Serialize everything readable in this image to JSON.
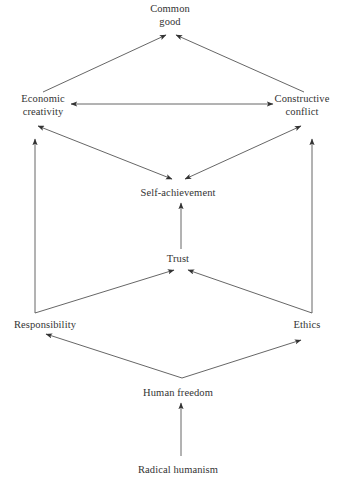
{
  "diagram": {
    "stroke_color": "#444444",
    "text_color": "#333333",
    "background": "#ffffff",
    "nodes": [
      {
        "id": "common_good",
        "label": "Common\ngood",
        "x": 170,
        "y": 14
      },
      {
        "id": "economic",
        "label": "Economic\ncreativity",
        "x": 43,
        "y": 105
      },
      {
        "id": "constructive",
        "label": "Constructive\nconflict",
        "x": 302,
        "y": 105
      },
      {
        "id": "self",
        "label": "Self-achievement",
        "x": 178,
        "y": 192
      },
      {
        "id": "trust",
        "label": "Trust",
        "x": 178,
        "y": 258
      },
      {
        "id": "responsibility",
        "label": "Responsibility",
        "x": 45,
        "y": 325
      },
      {
        "id": "ethics",
        "label": "Ethics",
        "x": 307,
        "y": 325
      },
      {
        "id": "human_freedom",
        "label": "Human freedom",
        "x": 178,
        "y": 392
      },
      {
        "id": "radical",
        "label": "Radical humanism",
        "x": 178,
        "y": 470
      }
    ],
    "edges": [
      {
        "id": "economic-to-common",
        "from": "economic",
        "to": "common_good",
        "arrows": "single"
      },
      {
        "id": "constructive-to-common",
        "from": "constructive",
        "to": "common_good",
        "arrows": "single"
      },
      {
        "id": "economic-constructive",
        "from": "economic",
        "to": "constructive",
        "arrows": "double"
      },
      {
        "id": "economic-self",
        "from": "economic",
        "to": "self",
        "arrows": "double"
      },
      {
        "id": "self-constructive",
        "from": "self",
        "to": "constructive",
        "arrows": "double"
      },
      {
        "id": "responsibility-to-economic",
        "from": "responsibility",
        "to": "economic",
        "arrows": "single"
      },
      {
        "id": "ethics-to-constructive",
        "from": "ethics",
        "to": "constructive",
        "arrows": "single"
      },
      {
        "id": "trust-to-self",
        "from": "trust",
        "to": "self",
        "arrows": "single"
      },
      {
        "id": "responsibility-to-trust",
        "from": "responsibility",
        "to": "trust",
        "arrows": "single"
      },
      {
        "id": "ethics-to-trust",
        "from": "ethics",
        "to": "trust",
        "arrows": "single"
      },
      {
        "id": "freedom-to-responsibility",
        "from": "human_freedom",
        "to": "responsibility",
        "arrows": "single"
      },
      {
        "id": "freedom-to-ethics",
        "from": "human_freedom",
        "to": "ethics",
        "arrows": "single"
      },
      {
        "id": "radical-to-freedom",
        "from": "radical",
        "to": "human_freedom",
        "arrows": "single"
      }
    ]
  }
}
